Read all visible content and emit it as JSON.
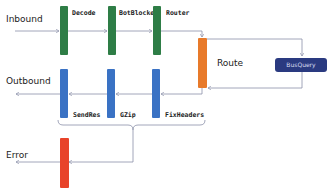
{
  "diagram": {
    "flows": {
      "inbound": "Inbound",
      "outbound": "Outbound",
      "error": "Error"
    },
    "inbound_stages": [
      {
        "label": "Decode",
        "color": "#2e7d46"
      },
      {
        "label": "BotBlocker",
        "color": "#2e7d46"
      },
      {
        "label": "Router",
        "color": "#2e7d46"
      }
    ],
    "route": {
      "label": "Route",
      "color": "#e87a2a"
    },
    "bus_query": {
      "label": "BusQuery",
      "color": "#2a3a80"
    },
    "outbound_stages": [
      {
        "label": "SendRes",
        "color": "#3a72c4"
      },
      {
        "label": "GZip",
        "color": "#3a72c4"
      },
      {
        "label": "FixHeaders",
        "color": "#3a72c4"
      }
    ],
    "error_stage": {
      "color": "#e8432a"
    },
    "line_color": "#8a8fa8"
  }
}
